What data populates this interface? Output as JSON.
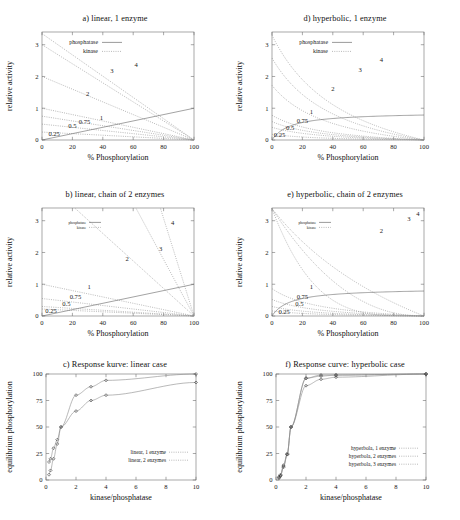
{
  "figure": {
    "width": 460,
    "height": 520,
    "background": "#ffffff",
    "ink": "#1a1a1a",
    "axis_color": "#6e6e6e",
    "curve_color": "#8e8e8e"
  },
  "panels": [
    {
      "id": "a",
      "title": "a) linear, 1 enzyme",
      "xlabel": "% Phosphorylation",
      "ylabel": "relative activity",
      "legend": [
        "phosphatase",
        "kinase"
      ],
      "curve_labels": [
        "0.25",
        "0.5",
        "0.75",
        "1",
        "2",
        "3",
        "4"
      ]
    },
    {
      "id": "d",
      "title": "d) hyperbolic, 1 enzyme",
      "xlabel": "% Phosphorylation",
      "ylabel": "relative activity",
      "legend": [
        "phosphatase",
        "kinase"
      ],
      "curve_labels": [
        "0.25",
        "0.5",
        "0.75",
        "1",
        "2",
        "3",
        "4"
      ]
    },
    {
      "id": "b",
      "title": "b) linear, chain of 2 enzymes",
      "xlabel": "% Phosphorylation",
      "ylabel": "relative activity",
      "legend": [
        "phosphatase",
        "kinase"
      ],
      "curve_labels": [
        "0.25",
        "0.5",
        "0.75",
        "1",
        "2",
        "3",
        "4"
      ]
    },
    {
      "id": "e",
      "title": "e) hyperbolic, chain of 2 enzymes",
      "xlabel": "% Phosphorylation",
      "ylabel": "relative activity",
      "legend": [
        "phosphatase",
        "kinase"
      ],
      "curve_labels": [
        "0.25",
        "0.5",
        "0.75",
        "1",
        "2",
        "3",
        "4"
      ]
    },
    {
      "id": "c",
      "title": "c) Response kurve: linear case",
      "xlabel": "kinase/phosphatase",
      "ylabel": "equilibrium phosphorylation",
      "legend": [
        "linear, 1 enzyme",
        "linear, 2 enzymes"
      ]
    },
    {
      "id": "f",
      "title": "f) Response curve: hyperbolic case",
      "xlabel": "kinase/phosphatase",
      "ylabel": "equilibrium phosphorylation",
      "legend": [
        "hyperbola, 1 enzyme",
        "hyperbola, 2 enzymes",
        "hyperbola, 3 enzymes"
      ]
    }
  ],
  "chart_data": [
    {
      "type": "line",
      "panel": "a",
      "title": "a) linear, 1 enzyme",
      "xlabel": "% Phosphorylation",
      "ylabel": "relative activity",
      "xlim": [
        0,
        100
      ],
      "ylim": [
        0,
        3.4
      ],
      "xticks": [
        0,
        20,
        40,
        60,
        80,
        100
      ],
      "yticks": [
        0,
        1,
        2,
        3
      ],
      "grid": false,
      "legend": [
        "phosphatase",
        "kinase"
      ],
      "legend_position": "upper-left",
      "series": [
        {
          "name": "phosphatase ratio 0.25",
          "label": "0.25",
          "style": "dotted",
          "x": [
            0,
            100
          ],
          "values": [
            0.25,
            0
          ]
        },
        {
          "name": "phosphatase ratio 0.5",
          "label": "0.5",
          "style": "dotted",
          "x": [
            0,
            100
          ],
          "values": [
            0.5,
            0
          ]
        },
        {
          "name": "phosphatase ratio 0.75",
          "label": "0.75",
          "style": "dotted",
          "x": [
            0,
            100
          ],
          "values": [
            0.75,
            0
          ]
        },
        {
          "name": "phosphatase ratio 1",
          "label": "1",
          "style": "dotted",
          "x": [
            0,
            100
          ],
          "values": [
            1.0,
            0
          ]
        },
        {
          "name": "phosphatase ratio 2",
          "label": "2",
          "style": "dotted",
          "x": [
            0,
            100
          ],
          "values": [
            2.0,
            0
          ]
        },
        {
          "name": "phosphatase ratio 3",
          "label": "3",
          "style": "dotted",
          "x": [
            0,
            100
          ],
          "values": [
            3.0,
            0
          ]
        },
        {
          "name": "phosphatase ratio 4",
          "label": "4",
          "style": "dotted",
          "x": [
            0,
            100
          ],
          "values": [
            3.35,
            0
          ]
        },
        {
          "name": "kinase",
          "label": "kinase",
          "style": "solid",
          "x": [
            0,
            100
          ],
          "values": [
            0,
            1.0
          ]
        }
      ]
    },
    {
      "type": "line",
      "panel": "d",
      "title": "d) hyperbolic, 1 enzyme",
      "xlabel": "% Phosphorylation",
      "ylabel": "relative activity",
      "xlim": [
        0,
        100
      ],
      "ylim": [
        0,
        3.4
      ],
      "xticks": [
        0,
        20,
        40,
        60,
        80,
        100
      ],
      "yticks": [
        0,
        1,
        2,
        3
      ],
      "grid": false,
      "legend": [
        "phosphatase",
        "kinase"
      ],
      "legend_position": "upper-left",
      "series": [
        {
          "name": "phosphatase ratio 0.25",
          "label": "0.25",
          "style": "hyperbolic-decay",
          "y0": 0.18,
          "exponent": 0.55
        },
        {
          "name": "phosphatase ratio 0.5",
          "label": "0.5",
          "style": "hyperbolic-decay",
          "y0": 0.4,
          "exponent": 0.55
        },
        {
          "name": "phosphatase ratio 0.75",
          "label": "0.75",
          "style": "hyperbolic-decay",
          "y0": 0.58,
          "exponent": 0.55
        },
        {
          "name": "phosphatase ratio 1",
          "label": "1",
          "style": "hyperbolic-decay",
          "y0": 0.78,
          "exponent": 0.55
        },
        {
          "name": "phosphatase ratio 2",
          "label": "2",
          "style": "hyperbolic-decay",
          "y0": 1.72,
          "exponent": 0.6
        },
        {
          "name": "phosphatase ratio 3",
          "label": "3",
          "style": "hyperbolic-decay",
          "y0": 2.58,
          "exponent": 0.68
        },
        {
          "name": "phosphatase ratio 4",
          "label": "4",
          "style": "hyperbolic-decay",
          "y0": 3.3,
          "exponent": 0.78
        },
        {
          "name": "kinase",
          "label": "kinase",
          "style": "hyperbolic-rise",
          "ymax": 0.88
        }
      ]
    },
    {
      "type": "line",
      "panel": "b",
      "title": "b) linear, chain of 2 enzymes",
      "xlabel": "% Phosphorylation",
      "ylabel": "relative activity",
      "xlim": [
        0,
        100
      ],
      "ylim": [
        0,
        3.4
      ],
      "xticks": [
        0,
        20,
        40,
        60,
        80,
        100
      ],
      "yticks": [
        0,
        1,
        2,
        3
      ],
      "grid": false,
      "legend": [
        "phosphatase",
        "kinase"
      ],
      "legend_position": "upper-left",
      "series": [
        {
          "name": "ratio 0.25",
          "label": "0.25",
          "style": "quadratic-decay",
          "y0": 0.22
        },
        {
          "name": "ratio 0.5",
          "label": "0.5",
          "style": "quadratic-decay",
          "y0": 0.3
        },
        {
          "name": "ratio 0.75",
          "label": "0.75",
          "style": "quadratic-decay",
          "y0": 0.55
        },
        {
          "name": "ratio 1",
          "label": "1",
          "style": "quadratic-decay",
          "y0": 1.0
        },
        {
          "name": "ratio 2",
          "label": "2",
          "style": "quadratic-decay",
          "y0": 3.38,
          "xstart": 22
        },
        {
          "name": "ratio 3",
          "label": "3",
          "style": "quadratic-decay",
          "y0": 3.38,
          "xstart": 62
        },
        {
          "name": "ratio 4",
          "label": "4",
          "style": "quadratic-decay",
          "y0": 3.38,
          "xstart": 78
        },
        {
          "name": "kinase",
          "label": "kinase",
          "style": "solid",
          "x": [
            0,
            100
          ],
          "values": [
            0,
            1.0
          ]
        }
      ]
    },
    {
      "type": "line",
      "panel": "e",
      "title": "e) hyperbolic, chain of 2 enzymes",
      "xlabel": "% Phosphorylation",
      "ylabel": "relative activity",
      "xlim": [
        0,
        100
      ],
      "ylim": [
        0,
        3.4
      ],
      "xticks": [
        0,
        20,
        40,
        60,
        80,
        100
      ],
      "yticks": [
        0,
        1,
        2,
        3
      ],
      "grid": false,
      "legend": [
        "phosphatase",
        "kinase"
      ],
      "legend_position": "upper-left",
      "series": [
        {
          "name": "ratio 0.25",
          "label": "0.25",
          "style": "hyperbolic-decay",
          "y0": 0.16,
          "exponent": 0.5
        },
        {
          "name": "ratio 0.5",
          "label": "0.5",
          "style": "hyperbolic-decay",
          "y0": 0.3,
          "exponent": 0.5
        },
        {
          "name": "ratio 0.75",
          "label": "0.75",
          "style": "hyperbolic-decay",
          "y0": 0.52,
          "exponent": 0.5
        },
        {
          "name": "ratio 1",
          "label": "1",
          "style": "hyperbolic-decay",
          "y0": 0.86,
          "exponent": 0.5
        },
        {
          "name": "ratio 2",
          "label": "2",
          "style": "hyperbolic-decay",
          "y0": 3.38,
          "exponent": 1.6
        },
        {
          "name": "ratio 3",
          "label": "3",
          "style": "hyperbolic-decay",
          "y0": 3.38,
          "exponent": 7.0
        },
        {
          "name": "ratio 4",
          "label": "4",
          "style": "hyperbolic-decay",
          "y0": 3.38,
          "exponent": 12.0
        },
        {
          "name": "kinase",
          "label": "kinase",
          "style": "hyperbolic-rise",
          "ymax": 0.88
        }
      ]
    },
    {
      "type": "scatter",
      "panel": "c",
      "title": "c) Response kurve: linear case",
      "xlabel": "kinase/phosphatase",
      "ylabel": "equilibrium phosphorylation",
      "xlim": [
        0,
        10
      ],
      "ylim": [
        0,
        100
      ],
      "xticks": [
        0,
        2,
        4,
        6,
        8,
        10
      ],
      "yticks": [
        0,
        25,
        50,
        75,
        100
      ],
      "grid": false,
      "legend": [
        "linear, 1 enzyme",
        "linear, 2 enzymes"
      ],
      "legend_position": "lower-right",
      "series": [
        {
          "name": "linear, 1 enzyme",
          "x": [
            0.2,
            0.3,
            0.5,
            0.75,
            1.0,
            2.0,
            3.0,
            4.0,
            10.0
          ],
          "values": [
            17,
            20,
            30,
            38,
            50,
            80,
            88,
            94,
            100
          ]
        },
        {
          "name": "linear, 2 enzymes",
          "x": [
            0.2,
            0.3,
            0.5,
            0.75,
            1.0,
            2.0,
            3.0,
            4.0,
            10.0
          ],
          "values": [
            5,
            9,
            20,
            34,
            50,
            65,
            75,
            80,
            92
          ]
        }
      ]
    },
    {
      "type": "scatter",
      "panel": "f",
      "title": "f) Response curve: hyperbolic case",
      "xlabel": "kinase/phosphatase",
      "ylabel": "equilibrium phosphorylation",
      "xlim": [
        0,
        10
      ],
      "ylim": [
        0,
        100
      ],
      "xticks": [
        0,
        2,
        4,
        6,
        8,
        10
      ],
      "yticks": [
        0,
        25,
        50,
        75,
        100
      ],
      "grid": false,
      "legend": [
        "hyperbola, 1 enzyme",
        "hyperbola, 2 enzymes",
        "hyperbola, 3 enzymes"
      ],
      "legend_position": "lower-right",
      "series": [
        {
          "name": "hyperbola, 1 enzyme",
          "x": [
            0.2,
            0.3,
            0.5,
            0.75,
            1.0,
            2.0,
            3.0,
            4.0,
            10.0
          ],
          "values": [
            3,
            5,
            14,
            25,
            50,
            96,
            99,
            99,
            100
          ]
        },
        {
          "name": "hyperbola, 2 enzymes",
          "x": [
            0.2,
            0.3,
            0.5,
            0.75,
            1.0,
            2.0,
            3.0,
            4.0,
            10.0
          ],
          "values": [
            2,
            4,
            12,
            24,
            50,
            89,
            95,
            97,
            100
          ]
        },
        {
          "name": "hyperbola, 3 enzymes",
          "x": [
            0.2,
            0.3,
            0.5,
            0.75,
            1.0,
            2.0,
            3.0,
            4.0,
            10.0
          ],
          "values": [
            2,
            4,
            13,
            24,
            50,
            96,
            98,
            99,
            100
          ]
        }
      ]
    }
  ]
}
